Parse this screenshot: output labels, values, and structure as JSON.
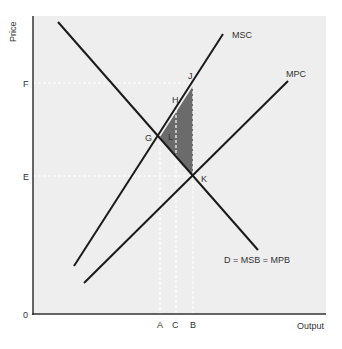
{
  "diagram": {
    "axes": {
      "y_label": "Price",
      "x_label": "Output",
      "origin_label": "0",
      "y_ticks": [
        "F",
        "E"
      ],
      "x_ticks": [
        "A",
        "C",
        "B"
      ]
    },
    "curves": [
      {
        "id": "demand",
        "label": "D = MSB = MPB"
      },
      {
        "id": "msc",
        "label": "MSC"
      },
      {
        "id": "mpc",
        "label": "MPC"
      }
    ],
    "points": [
      "G",
      "H",
      "J",
      "K",
      "L"
    ],
    "shaded_region": "triangle G-J-K (welfare loss)",
    "colors": {
      "plot_bg": "#eeeeee",
      "line": "#1a1a1a",
      "shade": "#6b6b6b",
      "guide": "#ffffff"
    }
  }
}
